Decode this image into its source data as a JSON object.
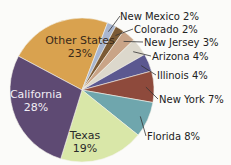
{
  "chart_data": {
    "type": "pie",
    "title": "",
    "categories": [
      "California",
      "Texas",
      "Florida",
      "New York",
      "Illinois",
      "Arizona",
      "New Jersey",
      "Colorado",
      "New Mexico",
      "Other States"
    ],
    "values": [
      28,
      19,
      8,
      7,
      4,
      4,
      3,
      2,
      2,
      23
    ],
    "unit": "%",
    "colors": [
      "#5e4a73",
      "#d9e7a8",
      "#6fa6ad",
      "#8e4a3c",
      "#5b5890",
      "#dcd8cc",
      "#c9a487",
      "#7b5a35",
      "#a9b6cf",
      "#d9a24f"
    ],
    "labels": [
      {
        "name": "California",
        "pct": "28%"
      },
      {
        "name": "Texas",
        "pct": "19%"
      },
      {
        "name": "Florida 8%"
      },
      {
        "name": "New York 7%"
      },
      {
        "name": "Illinois 4%"
      },
      {
        "name": "Arizona 4%"
      },
      {
        "name": "New Jersey 3%"
      },
      {
        "name": "Colorado 2%"
      },
      {
        "name": "New Mexico 2%"
      },
      {
        "name": "Other States",
        "pct": "23%"
      }
    ]
  }
}
